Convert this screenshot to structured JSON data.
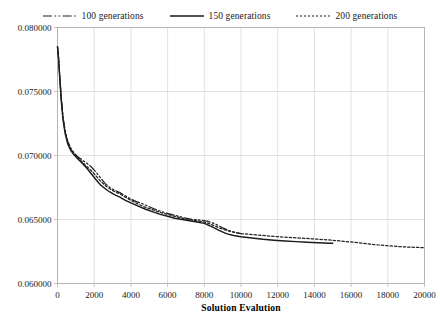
{
  "chart_data": {
    "type": "line",
    "title": "",
    "xlabel": "Solution Evalution",
    "ylabel": "",
    "xlim": [
      0,
      20000
    ],
    "ylim": [
      0.06,
      0.08
    ],
    "grid": true,
    "legend_position": "top-center",
    "x_ticks": [
      "0",
      "2000",
      "4000",
      "6000",
      "8000",
      "10000",
      "12000",
      "14000",
      "16000",
      "18000",
      "20000"
    ],
    "x_tick_values": [
      0,
      2000,
      4000,
      6000,
      8000,
      10000,
      12000,
      14000,
      16000,
      18000,
      20000
    ],
    "y_ticks": [
      "0.060000",
      "0.065000",
      "0.070000",
      "0.075000",
      "0.080000"
    ],
    "y_tick_values": [
      0.06,
      0.065,
      0.07,
      0.075,
      0.08
    ],
    "series": [
      {
        "name": "100 generations",
        "style": "dash-dot-dot",
        "color": "#222222",
        "x": [
          0,
          60,
          120,
          200,
          300,
          420,
          560,
          720,
          900,
          1100,
          1350,
          1600,
          1850,
          2100,
          2350,
          2600,
          2850,
          3100,
          3400,
          3700,
          4000,
          4300,
          4600,
          5000,
          5400,
          5800,
          6200,
          6600,
          7000,
          7400,
          7800,
          8200,
          8600,
          9000,
          9400,
          9800,
          10000
        ],
        "y": [
          0.0785,
          0.0776,
          0.0763,
          0.0746,
          0.073,
          0.0719,
          0.0711,
          0.0706,
          0.0702,
          0.0699,
          0.06965,
          0.0694,
          0.0691,
          0.0687,
          0.06825,
          0.0678,
          0.0675,
          0.0673,
          0.0671,
          0.06685,
          0.0666,
          0.0664,
          0.06625,
          0.066,
          0.06575,
          0.06555,
          0.0654,
          0.06525,
          0.0651,
          0.065,
          0.06495,
          0.06485,
          0.06465,
          0.06435,
          0.0641,
          0.06395,
          0.0639
        ]
      },
      {
        "name": "150 generations",
        "style": "solid",
        "color": "#1a1a1a",
        "x": [
          0,
          60,
          120,
          200,
          300,
          420,
          560,
          720,
          900,
          1100,
          1350,
          1600,
          1850,
          2100,
          2350,
          2600,
          2850,
          3100,
          3400,
          3700,
          4000,
          4400,
          4800,
          5200,
          5600,
          6000,
          6400,
          6800,
          7200,
          7600,
          8000,
          8400,
          8800,
          9200,
          9600,
          10000,
          10600,
          11200,
          11800,
          12400,
          13000,
          13600,
          14200,
          14800,
          15000
        ],
        "y": [
          0.0785,
          0.0775,
          0.0761,
          0.0744,
          0.0728,
          0.0717,
          0.0709,
          0.0704,
          0.07005,
          0.06975,
          0.0694,
          0.069,
          0.06855,
          0.0681,
          0.0677,
          0.0674,
          0.06715,
          0.06695,
          0.06675,
          0.0665,
          0.0663,
          0.06605,
          0.0658,
          0.0656,
          0.0654,
          0.06525,
          0.0651,
          0.065,
          0.0649,
          0.0648,
          0.0647,
          0.06445,
          0.06415,
          0.0639,
          0.06375,
          0.06365,
          0.06355,
          0.06345,
          0.06338,
          0.06332,
          0.06327,
          0.06322,
          0.06318,
          0.06315,
          0.06314
        ]
      },
      {
        "name": "200 generations",
        "style": "dotted",
        "color": "#222222",
        "x": [
          0,
          60,
          120,
          200,
          300,
          420,
          560,
          720,
          900,
          1100,
          1350,
          1600,
          1850,
          2100,
          2350,
          2600,
          2850,
          3100,
          3400,
          3700,
          4000,
          4400,
          4800,
          5200,
          5600,
          6000,
          6400,
          6800,
          7200,
          7600,
          8000,
          8400,
          8800,
          9200,
          9600,
          10000,
          10800,
          11600,
          12400,
          13200,
          14000,
          14800,
          15600,
          16400,
          17200,
          18000,
          18800,
          19400,
          20000
        ],
        "y": [
          0.0785,
          0.0776,
          0.0762,
          0.0745,
          0.0729,
          0.0718,
          0.071,
          0.0705,
          0.07015,
          0.06985,
          0.0695,
          0.06915,
          0.0688,
          0.0684,
          0.068,
          0.06765,
          0.0674,
          0.0672,
          0.067,
          0.06675,
          0.0665,
          0.0662,
          0.06595,
          0.06575,
          0.06555,
          0.0654,
          0.06525,
          0.0651,
          0.065,
          0.0649,
          0.0648,
          0.0646,
          0.06435,
          0.06415,
          0.064,
          0.0639,
          0.0638,
          0.0637,
          0.06362,
          0.06355,
          0.06348,
          0.0634,
          0.0633,
          0.06318,
          0.06305,
          0.06295,
          0.06287,
          0.06283,
          0.0628
        ]
      }
    ]
  },
  "legend": {
    "entries": [
      {
        "label": "100 generations"
      },
      {
        "label": "150 generations"
      },
      {
        "label": "200 generations"
      }
    ]
  },
  "axes": {
    "x_title": "Solution Evalution"
  },
  "colors": {
    "grid": "#d9d9d9",
    "frame": "#b5b5b5",
    "line": "#1a1a1a",
    "text": "#1a1a1a",
    "background": "#ffffff"
  }
}
